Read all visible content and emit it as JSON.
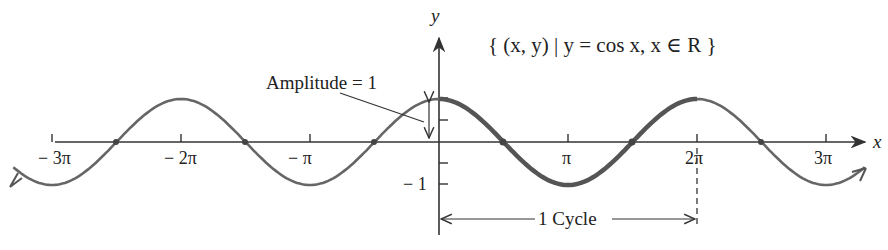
{
  "title": "{ (x, y) | y = cos x, x ∈ R }",
  "annotations": {
    "amplitude": "Amplitude = 1",
    "cycle": "1 Cycle"
  },
  "axes": {
    "x_label": "x",
    "y_label": "y",
    "x_ticks": [
      "− 3π",
      "− 2π",
      "− π",
      "π",
      "2π",
      "3π"
    ],
    "y_ticks": [
      "− 1"
    ]
  },
  "colors": {
    "curve": "#666666",
    "highlight": "#555555",
    "axis": "#333333",
    "text": "#222222"
  },
  "chart_data": {
    "type": "line",
    "title": "{ (x, y) | y = cos x, x ∈ R }",
    "xlabel": "x",
    "ylabel": "y",
    "function": "y = cos x",
    "xlim": [
      -3.3,
      3.3
    ],
    "xlim_units": "multiples of π",
    "ylim": [
      -1,
      1
    ],
    "x_tick_labels": [
      "-3π",
      "-2π",
      "-π",
      "π",
      "2π",
      "3π"
    ],
    "y_tick_labels": [
      "-1"
    ],
    "highlighted_cycle": [
      0,
      2
    ],
    "highlighted_cycle_units": "multiples of π",
    "amplitude": 1,
    "period": "2π",
    "annotations": [
      "Amplitude = 1",
      "1 Cycle"
    ],
    "series": [
      {
        "name": "cos x",
        "x": [
          -3,
          -2.5,
          -2,
          -1.5,
          -1,
          -0.5,
          0,
          0.5,
          1,
          1.5,
          2,
          2.5,
          3
        ],
        "values": [
          -1,
          0,
          1,
          0,
          -1,
          0,
          1,
          0,
          -1,
          0,
          1,
          0,
          -1
        ]
      }
    ]
  }
}
